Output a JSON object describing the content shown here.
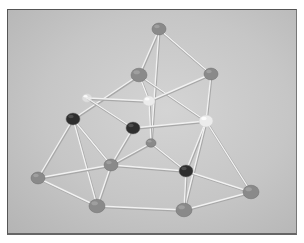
{
  "photo": {
    "subject": "gumdrop and toothpick geometric structure",
    "colors": {
      "background": "#c8c8c8",
      "gumdrop_light": "#8a8a8a",
      "gumdrop_dark": "#2e2e2e",
      "gumdrop_white": "#ececec",
      "stick": "#f2f2f2",
      "frame": "#555555"
    },
    "nodes": [
      {
        "id": "top",
        "x": 158,
        "y": 28,
        "r": 7,
        "tone": "light"
      },
      {
        "id": "upper-mid",
        "x": 138,
        "y": 74,
        "r": 8,
        "tone": "light"
      },
      {
        "id": "upper-right",
        "x": 210,
        "y": 73,
        "r": 7,
        "tone": "light"
      },
      {
        "id": "faint-left",
        "x": 86,
        "y": 97,
        "r": 5,
        "tone": "white"
      },
      {
        "id": "white-center",
        "x": 148,
        "y": 100,
        "r": 6,
        "tone": "white"
      },
      {
        "id": "white-right",
        "x": 205,
        "y": 120,
        "r": 7,
        "tone": "white"
      },
      {
        "id": "dark-left",
        "x": 72,
        "y": 118,
        "r": 7,
        "tone": "dark"
      },
      {
        "id": "dark-center",
        "x": 132,
        "y": 127,
        "r": 7,
        "tone": "dark"
      },
      {
        "id": "small-center",
        "x": 150,
        "y": 142,
        "r": 5,
        "tone": "light"
      },
      {
        "id": "mid",
        "x": 110,
        "y": 164,
        "r": 7,
        "tone": "light"
      },
      {
        "id": "dark-right",
        "x": 185,
        "y": 170,
        "r": 7,
        "tone": "dark"
      },
      {
        "id": "left-bottom",
        "x": 37,
        "y": 177,
        "r": 7,
        "tone": "light"
      },
      {
        "id": "right-bottom",
        "x": 250,
        "y": 191,
        "r": 8,
        "tone": "light"
      },
      {
        "id": "bottom-left",
        "x": 96,
        "y": 205,
        "r": 8,
        "tone": "light"
      },
      {
        "id": "bottom-right",
        "x": 183,
        "y": 209,
        "r": 8,
        "tone": "light"
      }
    ],
    "edges": [
      [
        "top",
        "upper-mid"
      ],
      [
        "top",
        "upper-right"
      ],
      [
        "top",
        "small-center"
      ],
      [
        "upper-mid",
        "dark-left"
      ],
      [
        "upper-mid",
        "white-center"
      ],
      [
        "upper-mid",
        "white-right"
      ],
      [
        "upper-right",
        "white-center"
      ],
      [
        "upper-right",
        "white-right"
      ],
      [
        "faint-left",
        "white-center"
      ],
      [
        "faint-left",
        "dark-center"
      ],
      [
        "white-center",
        "small-center"
      ],
      [
        "dark-center",
        "white-right"
      ],
      [
        "dark-center",
        "mid"
      ],
      [
        "white-right",
        "dark-right"
      ],
      [
        "white-right",
        "bottom-right"
      ],
      [
        "white-right",
        "right-bottom"
      ],
      [
        "dark-left",
        "left-bottom"
      ],
      [
        "dark-left",
        "mid"
      ],
      [
        "dark-left",
        "bottom-left"
      ],
      [
        "small-center",
        "mid"
      ],
      [
        "small-center",
        "dark-right"
      ],
      [
        "mid",
        "left-bottom"
      ],
      [
        "mid",
        "bottom-left"
      ],
      [
        "mid",
        "dark-right"
      ],
      [
        "left-bottom",
        "bottom-left"
      ],
      [
        "dark-right",
        "bottom-right"
      ],
      [
        "dark-right",
        "right-bottom"
      ],
      [
        "bottom-left",
        "bottom-right"
      ],
      [
        "bottom-right",
        "right-bottom"
      ]
    ]
  }
}
